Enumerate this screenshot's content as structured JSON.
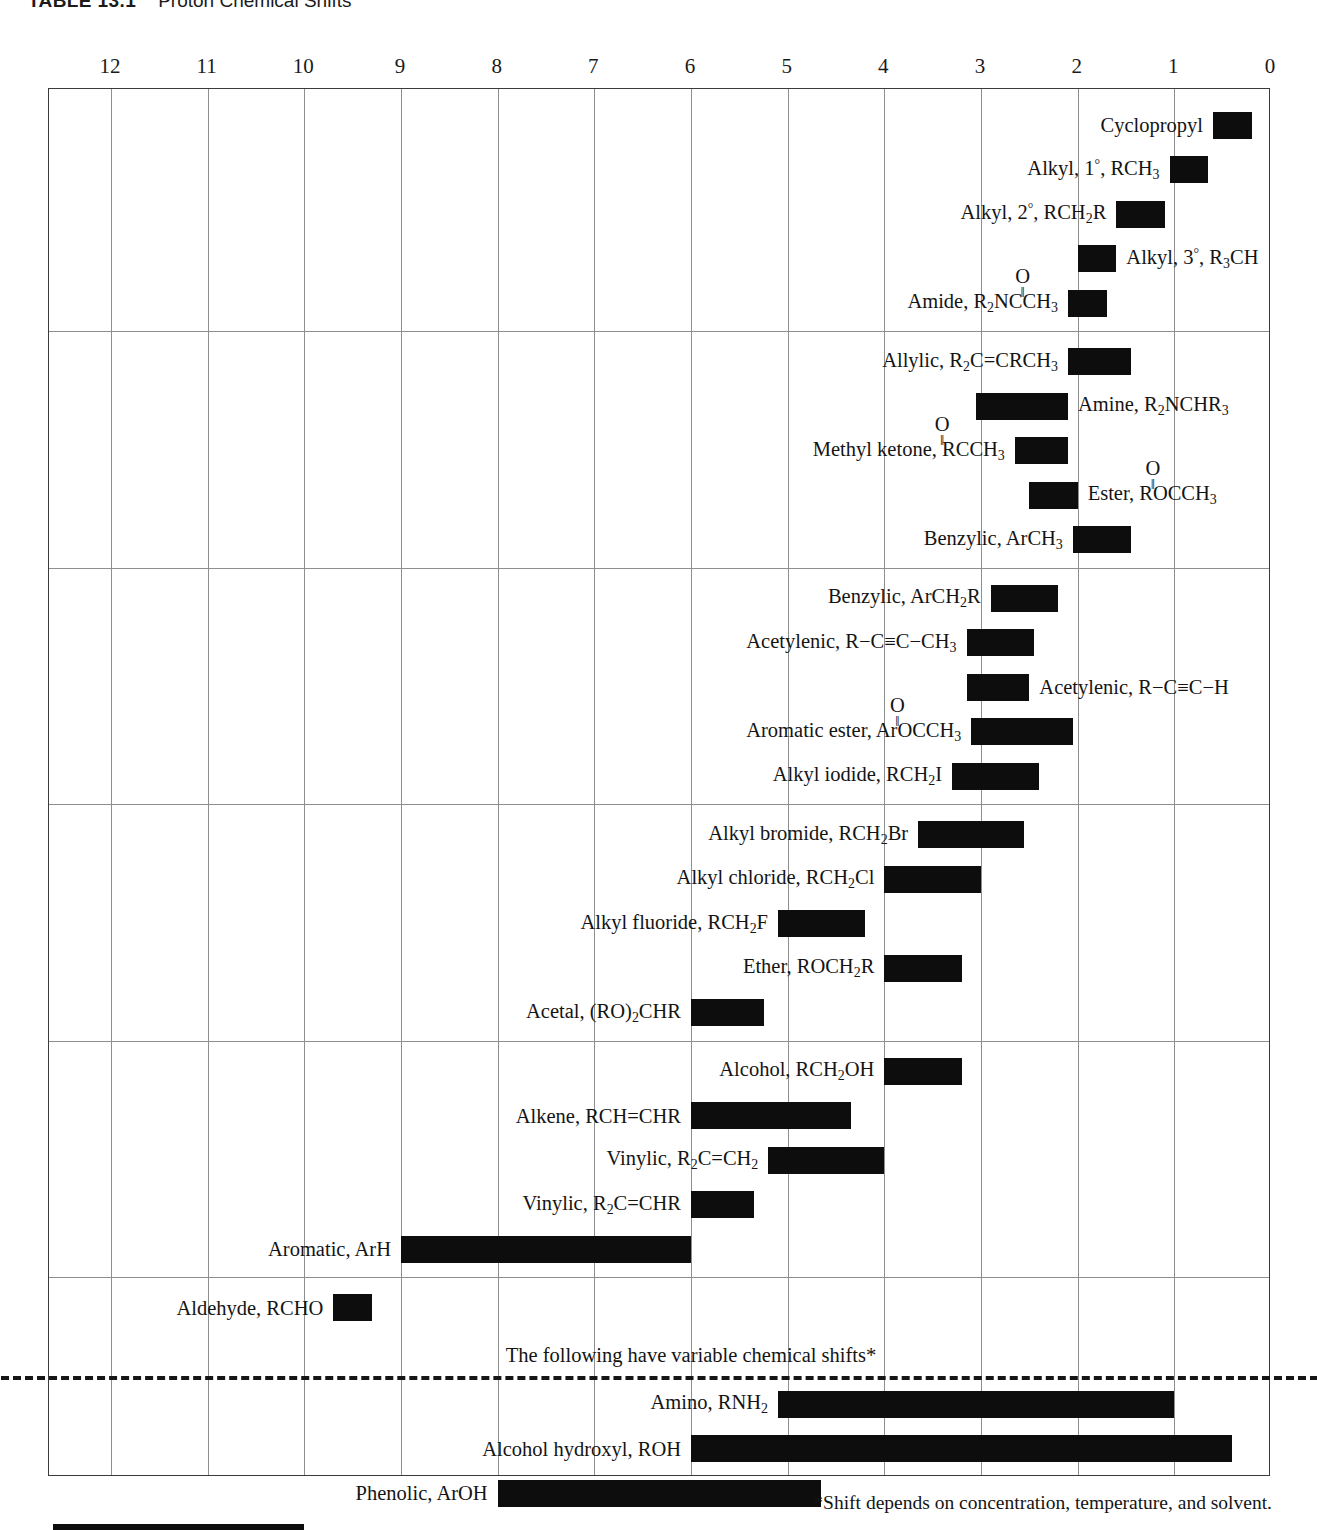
{
  "title": {
    "number": "TABLE 13.1",
    "caption": "Proton Chemical Shifts"
  },
  "axis": {
    "label": "Chemical shift (ppm, δ)",
    "min_ppm": 0,
    "max_ppm": 12,
    "ticks": [
      "12",
      "11",
      "10",
      "9",
      "8",
      "7",
      "6",
      "5",
      "4",
      "3",
      "2",
      "1",
      "0"
    ]
  },
  "notes": {
    "variable": "The following have variable chemical shifts*",
    "footnote": "*Shift depends on concentration, temperature, and solvent."
  },
  "labels": {
    "cyclopropyl": "Cyclopropyl",
    "alkyl_1_a": "Alkyl, 1",
    "alkyl_1_b": ", RCH",
    "alkyl_1_sub": "3",
    "alkyl_2_a": "Alkyl, 2",
    "alkyl_2_b": ", RCH",
    "alkyl_2_sub": "2",
    "alkyl_2_c": "R",
    "alkyl_3_a": "Alkyl, 3",
    "alkyl_3_b": ", R",
    "alkyl_3_sub": "3",
    "alkyl_3_c": "CH",
    "amide_a": "Amide, R",
    "amide_sub": "2",
    "amide_b": "NCCH",
    "amide_sub2": "3",
    "allylic_a": "Allylic, R",
    "allylic_sub": "2",
    "allylic_b": "C=CRCH",
    "allylic_sub2": "3",
    "amine_a": "Amine, R",
    "amine_sub": "2",
    "amine_b": "NCHR",
    "amine_sub2": "3",
    "methylketone_a": "Methyl ketone, RCCH",
    "methylketone_sub": "3",
    "ester_a": "Ester, ROCCH",
    "ester_sub": "3",
    "benzylic3_a": "Benzylic, ArCH",
    "benzylic3_sub": "3",
    "benzylic2_a": "Benzylic, ArCH",
    "benzylic2_sub": "2",
    "benzylic2_b": "R",
    "acetylenic_me_a": "Acetylenic, R−C≡C−CH",
    "acetylenic_me_sub": "3",
    "acetylenic_h": "Acetylenic, R−C≡C−H",
    "aromester_a": "Aromatic ester, ArOCCH",
    "aromester_sub": "3",
    "alkyliodide_a": "Alkyl iodide, RCH",
    "alkyliodide_sub": "2",
    "alkyliodide_b": "I",
    "alkylbromide_a": "Alkyl bromide, RCH",
    "alkylbromide_sub": "2",
    "alkylbromide_b": "Br",
    "alkylchloride_a": "Alkyl chloride, RCH",
    "alkylchloride_sub": "2",
    "alkylchloride_b": "Cl",
    "alkylfluoride_a": "Alkyl fluoride, RCH",
    "alkylfluoride_sub": "2",
    "alkylfluoride_b": "F",
    "ether_a": "Ether, ROCH",
    "ether_sub": "2",
    "ether_b": "R",
    "acetal_a": "Acetal, (RO)",
    "acetal_sub": "2",
    "acetal_b": "CHR",
    "alcohol_a": "Alcohol, RCH",
    "alcohol_sub": "2",
    "alcohol_b": "OH",
    "alkene": "Alkene, RCH=CHR",
    "vinylic_ch2_a": "Vinylic, R",
    "vinylic_ch2_sub": "2",
    "vinylic_ch2_b": "C=CH",
    "vinylic_ch2_sub2": "2",
    "vinylic_chr_a": "Vinylic, R",
    "vinylic_chr_sub": "2",
    "vinylic_chr_b": "C=CHR",
    "aromatic": "Aromatic, ArH",
    "aldehyde": "Aldehyde, RCHO",
    "amino_a": "Amino, RNH",
    "amino_sub": "2",
    "alcohol_hydroxyl": "Alcohol hydroxyl, ROH",
    "phenolic": "Phenolic, ArOH",
    "carboxylic": "Carboxylic, RCOOH",
    "oxygen": "O",
    "double_bond": "‖",
    "degree": "°"
  },
  "chart_data": {
    "type": "bar",
    "orientation": "horizontal-range",
    "title": "Proton Chemical Shifts",
    "xlabel": "Chemical shift δ (ppm)",
    "ylabel": "",
    "xlim": [
      12,
      0
    ],
    "x_axis_reversed": true,
    "grid": true,
    "legend": "none",
    "bar_color": "#0d0d0d",
    "groups": [
      {
        "rows": [
          {
            "name": "Cyclopropyl",
            "ppm_start": 0.6,
            "ppm_end": 0.2,
            "label_side": "left"
          },
          {
            "name": "Alkyl, 1°, RCH3",
            "ppm_start": 1.05,
            "ppm_end": 0.65,
            "label_side": "left"
          },
          {
            "name": "Alkyl, 2°, RCH2R",
            "ppm_start": 1.6,
            "ppm_end": 1.1,
            "label_side": "left"
          },
          {
            "name": "Alkyl, 3°, R3CH",
            "ppm_start": 2.0,
            "ppm_end": 1.6,
            "label_side": "right"
          },
          {
            "name": "Amide, R2NCOCH3",
            "ppm_start": 2.1,
            "ppm_end": 1.7,
            "label_side": "left"
          }
        ]
      },
      {
        "rows": [
          {
            "name": "Allylic, R2C=CRCH3",
            "ppm_start": 2.1,
            "ppm_end": 1.45,
            "label_side": "left"
          },
          {
            "name": "Amine, R2NCHR3",
            "ppm_start": 3.05,
            "ppm_end": 2.1,
            "label_side": "right"
          },
          {
            "name": "Methyl ketone, RCOCH3",
            "ppm_start": 2.65,
            "ppm_end": 2.1,
            "label_side": "left"
          },
          {
            "name": "Ester, ROCOCH3",
            "ppm_start": 2.5,
            "ppm_end": 2.0,
            "label_side": "right"
          },
          {
            "name": "Benzylic, ArCH3",
            "ppm_start": 2.05,
            "ppm_end": 1.45,
            "label_side": "left"
          }
        ]
      },
      {
        "rows": [
          {
            "name": "Benzylic, ArCH2R",
            "ppm_start": 2.9,
            "ppm_end": 2.2,
            "label_side": "left"
          },
          {
            "name": "Acetylenic, R-C≡C-CH3",
            "ppm_start": 3.15,
            "ppm_end": 2.45,
            "label_side": "left"
          },
          {
            "name": "Acetylenic, R-C≡C-H",
            "ppm_start": 3.15,
            "ppm_end": 2.5,
            "label_side": "right"
          },
          {
            "name": "Aromatic ester, ArOCOCH3",
            "ppm_start": 3.1,
            "ppm_end": 2.05,
            "label_side": "left"
          },
          {
            "name": "Alkyl iodide, RCH2I",
            "ppm_start": 3.3,
            "ppm_end": 2.4,
            "label_side": "left"
          }
        ]
      },
      {
        "rows": [
          {
            "name": "Alkyl bromide, RCH2Br",
            "ppm_start": 3.65,
            "ppm_end": 2.55,
            "label_side": "left"
          },
          {
            "name": "Alkyl chloride, RCH2Cl",
            "ppm_start": 4.0,
            "ppm_end": 3.0,
            "label_side": "left"
          },
          {
            "name": "Alkyl fluoride, RCH2F",
            "ppm_start": 5.1,
            "ppm_end": 4.2,
            "label_side": "left"
          },
          {
            "name": "Ether, ROCH2R",
            "ppm_start": 4.0,
            "ppm_end": 3.2,
            "label_side": "left"
          },
          {
            "name": "Acetal, (RO)2CHR",
            "ppm_start": 6.0,
            "ppm_end": 5.25,
            "label_side": "left"
          }
        ]
      },
      {
        "rows": [
          {
            "name": "Alcohol, RCH2OH",
            "ppm_start": 4.0,
            "ppm_end": 3.2,
            "label_side": "left"
          },
          {
            "name": "Alkene, RCH=CHR",
            "ppm_start": 6.0,
            "ppm_end": 4.35,
            "label_side": "left"
          },
          {
            "name": "Vinylic, R2C=CH2",
            "ppm_start": 5.2,
            "ppm_end": 4.0,
            "label_side": "left"
          },
          {
            "name": "Vinylic, R2C=CHR",
            "ppm_start": 6.0,
            "ppm_end": 5.35,
            "label_side": "left"
          },
          {
            "name": "Aromatic, ArH",
            "ppm_start": 9.0,
            "ppm_end": 6.0,
            "label_side": "left"
          }
        ]
      },
      {
        "rows": [
          {
            "name": "Aldehyde, RCHO",
            "ppm_start": 9.7,
            "ppm_end": 9.3,
            "label_side": "left"
          }
        ]
      },
      {
        "variable": true,
        "rows": [
          {
            "name": "Amino, RNH2",
            "ppm_start": 5.1,
            "ppm_end": 1.0,
            "label_side": "left"
          },
          {
            "name": "Alcohol hydroxyl, ROH",
            "ppm_start": 6.0,
            "ppm_end": 0.4,
            "label_side": "left"
          },
          {
            "name": "Phenolic, ArOH",
            "ppm_start": 8.0,
            "ppm_end": 4.65,
            "label_side": "left"
          },
          {
            "name": "Carboxylic, RCOOH",
            "ppm_start": 12.6,
            "ppm_end": 10.0,
            "label_side": "left"
          }
        ]
      }
    ]
  }
}
